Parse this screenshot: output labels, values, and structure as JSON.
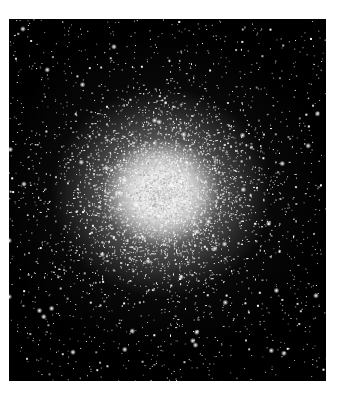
{
  "image": {
    "subject": "Globular star cluster",
    "description": "Dense spherical concentration of stars, bright white core fading to scattered stars on a black sky background",
    "colors": {
      "background": "#ffffff",
      "sky": "#000000",
      "core": "#f0f0f0",
      "stars": "#ffffff"
    }
  }
}
